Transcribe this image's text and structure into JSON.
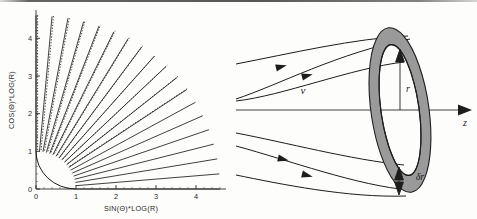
{
  "figure": {
    "caption": "",
    "panels": [
      "polar-log-ray-plot",
      "flux-tube-annulus-diagram"
    ]
  },
  "left_panel": {
    "name": "polar-log-ray-plot",
    "axes": {
      "x_label": "SIN(Θ)*LOG(R)",
      "y_label": "COS(Θ)*LOG(R)",
      "x_ticks": [
        "0",
        "1",
        "2",
        "3",
        "4"
      ],
      "y_ticks": [
        "0",
        "1",
        "2",
        "3",
        "4"
      ],
      "x_min": 0,
      "x_max": 4.75,
      "y_min": 0,
      "y_max": 4.75
    },
    "inner_arc_radius": 1.0,
    "ray_count": 19,
    "ray_angles_deg": [
      0,
      5,
      10,
      15,
      20,
      25,
      30,
      35,
      40,
      45,
      50,
      55,
      60,
      65,
      70,
      75,
      80,
      85,
      90
    ],
    "ray_outer_radius": 4.6,
    "dashed_overlay_from_angle_deg": 35,
    "line_color": "#1d1d1d"
  },
  "right_panel": {
    "name": "flux-tube-annulus-diagram",
    "labels": {
      "velocity": "v",
      "radius": "r",
      "thickness": "δr",
      "axis": "z"
    },
    "axis_label_position": "right-of-arrow",
    "annulus": {
      "fill_color": "#9a9a9a",
      "stroke_color": "#1d1d1d",
      "center_x": 400,
      "center_y": 110,
      "outer_rx": 29,
      "outer_ry": 83,
      "inner_rx": 19,
      "inner_ry": 66,
      "tilt_deg": -8
    },
    "streamlines": 4,
    "arrowheads": 4,
    "axis_line": {
      "y": 110,
      "from_x": 236,
      "to_x": 470
    }
  }
}
